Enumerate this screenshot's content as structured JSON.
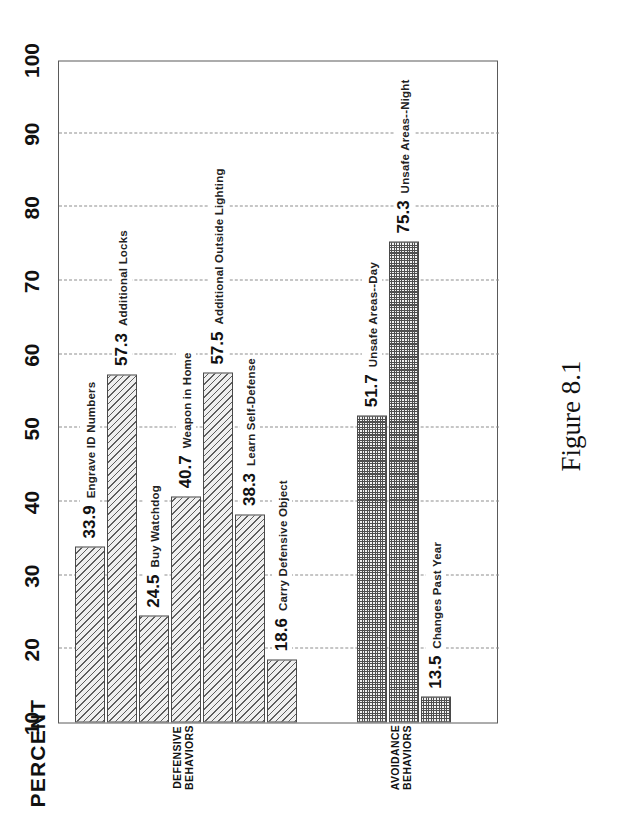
{
  "figure": {
    "caption": "Figure 8.1"
  },
  "chart_data": {
    "type": "bar",
    "title": "",
    "xlabel": "",
    "ylabel": "PERCENT",
    "ylim": [
      10,
      100
    ],
    "yticks": [
      10,
      20,
      30,
      40,
      50,
      60,
      70,
      80,
      90,
      100
    ],
    "grid": true,
    "orientation": "vertical-rotated",
    "legend": "none",
    "groups": [
      {
        "name": "DEFENSIVE\nBEHAVIORS",
        "pattern": "diagonal-hatch",
        "categories": [
          "Engrave ID Numbers",
          "Additional Locks",
          "Buy Watchdog",
          "Weapon in Home",
          "Additional Outside Lighting",
          "Learn Self-Defense",
          "Carry Defensive Object"
        ],
        "values": [
          33.9,
          57.3,
          24.5,
          40.7,
          57.5,
          38.3,
          18.6
        ]
      },
      {
        "name": "AVOIDANCE\nBEHAVIORS",
        "pattern": "stipple-checker",
        "categories": [
          "Unsafe Areas--Day",
          "Unsafe Areas--Night",
          "Changes Past Year"
        ],
        "values": [
          51.7,
          75.3,
          13.5
        ]
      }
    ]
  },
  "axis": {
    "tick_labels": [
      "10",
      "20",
      "30",
      "40",
      "50",
      "60",
      "70",
      "80",
      "90",
      "100"
    ],
    "title": "PERCENT"
  },
  "bars": [
    {
      "value": "33.9",
      "label": "Engrave ID Numbers",
      "group": 0
    },
    {
      "value": "57.3",
      "label": "Additional Locks",
      "group": 0
    },
    {
      "value": "24.5",
      "label": "Buy Watchdog",
      "group": 0
    },
    {
      "value": "40.7",
      "label": "Weapon in Home",
      "group": 0
    },
    {
      "value": "57.5",
      "label": "Additional Outside Lighting",
      "group": 0
    },
    {
      "value": "38.3",
      "label": "Learn Self-Defense",
      "group": 0
    },
    {
      "value": "18.6",
      "label": "Carry Defensive Object",
      "group": 0
    },
    {
      "value": "51.7",
      "label": "Unsafe Areas--Day",
      "group": 1
    },
    {
      "value": "75.3",
      "label": "Unsafe Areas--Night",
      "group": 1
    },
    {
      "value": "13.5",
      "label": "Changes Past Year",
      "group": 1
    }
  ],
  "groups": [
    {
      "label": "DEFENSIVE\nBEHAVIORS"
    },
    {
      "label": "AVOIDANCE\nBEHAVIORS"
    }
  ],
  "colors": {
    "frame": "#5a5a5a",
    "grid": "#8d8d8d",
    "bar_ink": "#5d5d5d",
    "text": "#111111",
    "background": "#ffffff"
  }
}
